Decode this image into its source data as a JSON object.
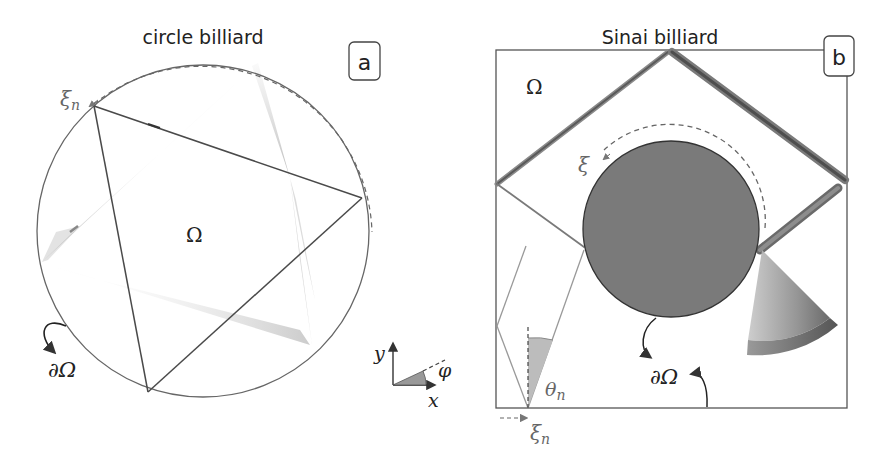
{
  "panels": {
    "a": {
      "title": "circle billiard",
      "label": "a",
      "domain_symbol": "Ω",
      "boundary_symbol": "∂Ω",
      "coordinate_label": "ξ",
      "coordinate_subscript": "n",
      "axes": {
        "x_label": "x",
        "y_label": "y",
        "angle_label": "φ"
      }
    },
    "b": {
      "title": "Sinai billiard",
      "label": "b",
      "domain_symbol": "Ω",
      "boundary_symbol": "∂Ω",
      "arc_coordinate_label": "ξ",
      "coordinate_label": "ξ",
      "coordinate_subscript": "n",
      "angle_label": "θ",
      "angle_subscript": "n"
    }
  },
  "colors": {
    "line": "#555555",
    "dark_line": "#4a4a4a",
    "scatterer_fill": "#7a7a7a",
    "wedge_fill": "#9a9a9a",
    "angle_fill": "#bdbdbd",
    "text": "#222222",
    "grey_text": "#666666"
  }
}
